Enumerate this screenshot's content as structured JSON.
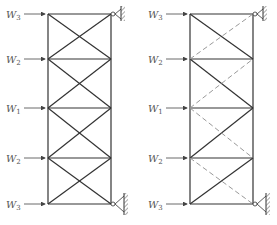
{
  "figure": {
    "left_truss": {
      "loads": [
        {
          "symbol": "W",
          "sub": "3"
        },
        {
          "symbol": "W",
          "sub": "2"
        },
        {
          "symbol": "W",
          "sub": "1"
        },
        {
          "symbol": "W",
          "sub": "2"
        },
        {
          "symbol": "W",
          "sub": "3"
        }
      ],
      "supports": [
        "pin-top-right",
        "pin-bottom-right"
      ]
    },
    "right_truss": {
      "loads": [
        {
          "symbol": "W",
          "sub": "3"
        },
        {
          "symbol": "W",
          "sub": "2"
        },
        {
          "symbol": "W",
          "sub": "1"
        },
        {
          "symbol": "W",
          "sub": "2"
        },
        {
          "symbol": "W",
          "sub": "3"
        }
      ],
      "supports": [
        "pin-top-right",
        "pin-bottom-right"
      ],
      "dashed_diagonals": "bottom-left to top-right in upper panels; top-left to bottom-right in lower panels"
    }
  }
}
